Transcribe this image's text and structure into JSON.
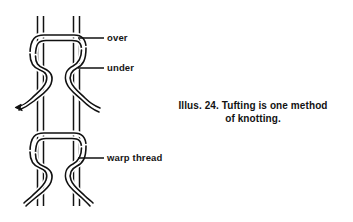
{
  "figure": {
    "name": "tufting-knot-diagram",
    "caption_line_1": "Illus. 24. Tufting is one method",
    "caption_line_2": "of knotting.",
    "caption_full": "Illus. 24. Tufting is one method of knotting.",
    "figure_number": "Illus. 24.",
    "background_color": "#ffffff",
    "ink_color": "#111111"
  },
  "callouts": {
    "over": {
      "label": "over",
      "target": "tuft-yarn-passing-over-warp"
    },
    "under": {
      "label": "under",
      "target": "tuft-yarn-passing-under-warp"
    },
    "warp": {
      "label": "warp thread",
      "target": "vertical-warp-thread"
    }
  },
  "diagram": {
    "warp_thread_count": 2,
    "knot_count": 2,
    "left_warp_label": "left warp thread",
    "right_warp_label": "right warp thread",
    "upper_knot_label": "upper tufting knot",
    "lower_knot_label": "lower tufting knot",
    "tuft_tail_label": "cut tuft end"
  }
}
